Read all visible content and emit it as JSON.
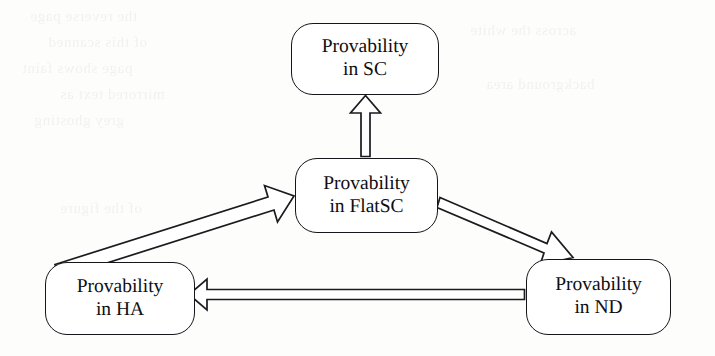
{
  "figure": {
    "background_color": "#fdfdfc",
    "ink_color": "#16161a",
    "width": 715,
    "height": 356
  },
  "nodes": [
    {
      "id": "sc",
      "line1": "Provability",
      "line2": "in SC",
      "system": "SC"
    },
    {
      "id": "flatsc",
      "line1": "Provability",
      "line2": "in FlatSC",
      "system": "FlatSC"
    },
    {
      "id": "ha",
      "line1": "Provability",
      "line2": "in HA",
      "system": "HA"
    },
    {
      "id": "nd",
      "line1": "Provability",
      "line2": "in ND",
      "system": "ND"
    }
  ],
  "edges": [
    {
      "id": "flatsc-to-sc",
      "from": "flatsc",
      "to": "sc",
      "style": "hollow-block-arrow",
      "direction": "up",
      "label": ""
    },
    {
      "id": "ha-to-flatsc",
      "from": "ha",
      "to": "flatsc",
      "style": "hollow-block-arrow",
      "direction": "up-right",
      "label": ""
    },
    {
      "id": "flatsc-to-nd",
      "from": "flatsc",
      "to": "nd",
      "style": "hollow-block-arrow",
      "direction": "down-right",
      "label": ""
    },
    {
      "id": "nd-to-ha",
      "from": "nd",
      "to": "ha",
      "style": "hollow-block-arrow",
      "direction": "left",
      "label": ""
    }
  ],
  "bleed_through": {
    "visible": true,
    "lines": [
      "the reverse page",
      "of this scanned",
      "page shows faint",
      "mirrored text as",
      "grey ghosting",
      "across the white",
      "background area",
      "of the figure"
    ]
  }
}
